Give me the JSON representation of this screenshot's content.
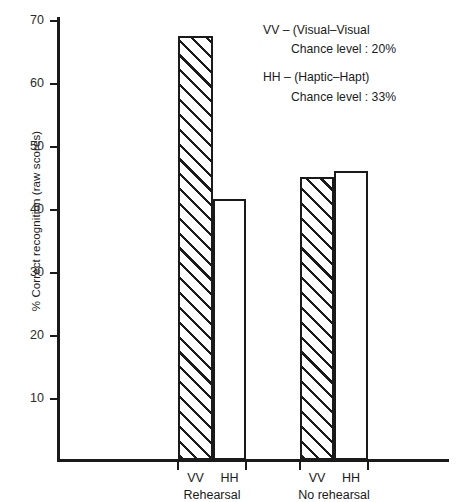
{
  "chart_data": {
    "type": "bar",
    "title": "",
    "xlabel": "",
    "ylabel": "% Correct recognition (raw scores)",
    "ylim": [
      0,
      70
    ],
    "yticks": [
      10,
      20,
      30,
      40,
      50,
      60,
      70
    ],
    "ytick_labels": [
      "10",
      "20",
      "30",
      "40",
      "50",
      "60",
      "70"
    ],
    "grid": false,
    "legend_position": "top-right",
    "categories": [
      "Rehearsal",
      "No rehearsal"
    ],
    "series": [
      {
        "name": "VV",
        "style": "hatched",
        "values": [
          67.5,
          45
        ]
      },
      {
        "name": "HH",
        "style": "open",
        "values": [
          41.5,
          46
        ]
      }
    ],
    "bars": [
      {
        "group": "Rehearsal",
        "condition": "VV",
        "value": 67.5,
        "fill": "hatched"
      },
      {
        "group": "Rehearsal",
        "condition": "HH",
        "value": 41.5,
        "fill": "open"
      },
      {
        "group": "No rehearsal",
        "condition": "VV",
        "value": 45,
        "fill": "hatched"
      },
      {
        "group": "No rehearsal",
        "condition": "HH",
        "value": 46,
        "fill": "open"
      }
    ],
    "annotations": [
      "VV – (Visual–Visual   Chance level : 20%",
      "HH – (Haptic–Hapt)   Chance level : 33%"
    ]
  },
  "axis": {
    "y_title": "% Correct recognition (raw scores)",
    "tick_70": "70",
    "tick_60": "60",
    "tick_50": "50",
    "tick_40": "40",
    "tick_30": "30",
    "tick_20": "20",
    "tick_10": "10"
  },
  "xaxis": {
    "group1": {
      "cond_a": "VV",
      "cond_b": "HH",
      "label": "Rehearsal"
    },
    "group2": {
      "cond_a": "VV",
      "cond_b": "HH",
      "label": "No rehearsal"
    }
  },
  "legend": {
    "vv_line1": "VV  –  (Visual–Visual",
    "vv_line2": "Chance level : 20%",
    "hh_line1": "HH  –  (Haptic–Hapt)",
    "hh_line2": "Chance level : 33%"
  },
  "colors": {
    "ink": "#1a1a1a",
    "background": "#ffffff"
  }
}
